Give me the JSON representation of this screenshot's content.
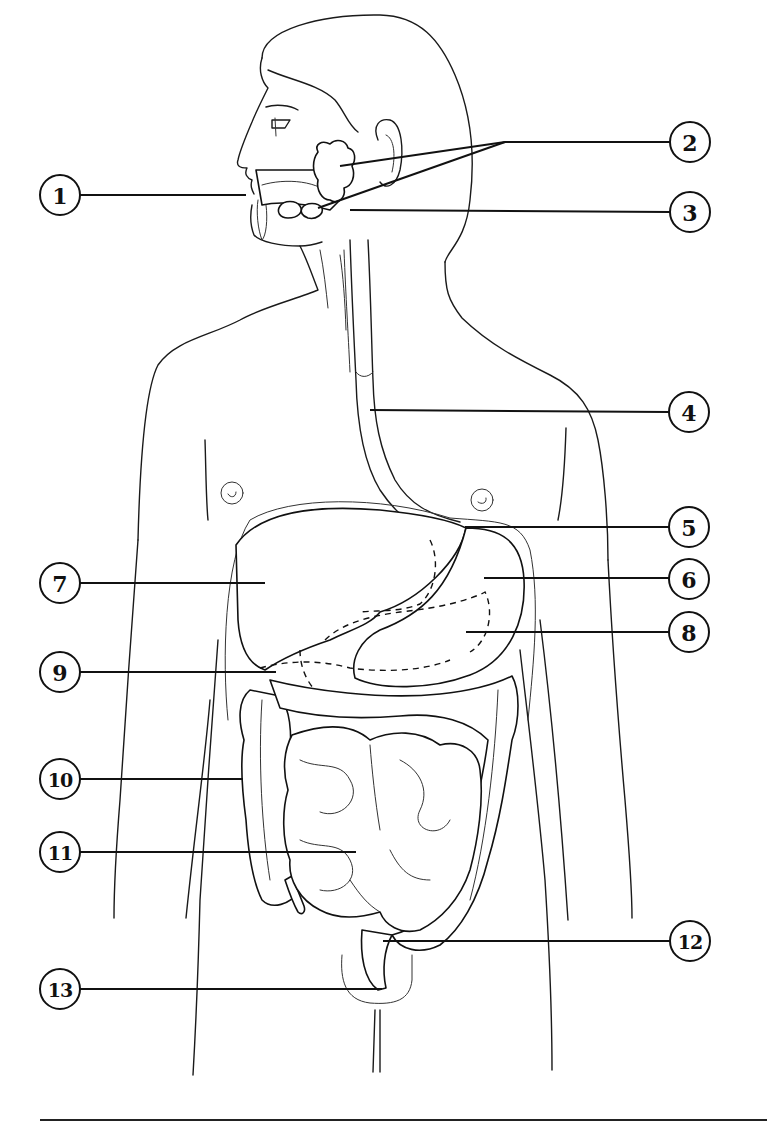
{
  "diagram": {
    "title": "",
    "style": "black line art on white, numbered callouts",
    "colors": {
      "line": "#111111",
      "background": "#ffffff"
    }
  },
  "callouts": [
    {
      "number": "1",
      "side": "left",
      "circle": [
        60,
        195
      ],
      "leader": [
        [
          80,
          195
        ],
        [
          246,
          195
        ]
      ]
    },
    {
      "number": "2",
      "side": "right",
      "circle": [
        690,
        142
      ],
      "leader": [
        [
          670,
          142
        ],
        [
          505,
          142
        ]
      ],
      "branches": [
        [
          [
            505,
            142
          ],
          [
            340,
            166
          ]
        ],
        [
          [
            505,
            142
          ],
          [
            318,
            208
          ]
        ]
      ]
    },
    {
      "number": "3",
      "side": "right",
      "circle": [
        690,
        212
      ],
      "leader": [
        [
          670,
          212
        ],
        [
          350,
          210
        ]
      ]
    },
    {
      "number": "4",
      "side": "right",
      "circle": [
        689,
        412
      ],
      "leader": [
        [
          669,
          412
        ],
        [
          370,
          410
        ]
      ]
    },
    {
      "number": "5",
      "side": "right",
      "circle": [
        689,
        527
      ],
      "leader": [
        [
          669,
          527
        ],
        [
          465,
          527
        ]
      ]
    },
    {
      "number": "6",
      "side": "right",
      "circle": [
        689,
        579
      ],
      "leader": [
        [
          669,
          578
        ],
        [
          484,
          578
        ]
      ]
    },
    {
      "number": "7",
      "side": "left",
      "circle": [
        60,
        583
      ],
      "leader": [
        [
          80,
          583
        ],
        [
          265,
          583
        ]
      ]
    },
    {
      "number": "8",
      "side": "right",
      "circle": [
        689,
        632
      ],
      "leader": [
        [
          669,
          632
        ],
        [
          466,
          632
        ]
      ]
    },
    {
      "number": "9",
      "side": "left",
      "circle": [
        60,
        672
      ],
      "leader": [
        [
          80,
          672
        ],
        [
          276,
          672
        ]
      ]
    },
    {
      "number": "10",
      "side": "left",
      "circle": [
        60,
        779
      ],
      "leader": [
        [
          80,
          779
        ],
        [
          243,
          779
        ]
      ]
    },
    {
      "number": "11",
      "side": "left",
      "circle": [
        60,
        852
      ],
      "leader": [
        [
          80,
          852
        ],
        [
          356,
          852
        ]
      ]
    },
    {
      "number": "12",
      "side": "right",
      "circle": [
        690,
        941
      ],
      "leader": [
        [
          670,
          941
        ],
        [
          383,
          941
        ]
      ]
    },
    {
      "number": "13",
      "side": "left",
      "circle": [
        60,
        989
      ],
      "leader": [
        [
          80,
          989
        ],
        [
          382,
          989
        ]
      ]
    }
  ],
  "footer_rule": {
    "x1": 40,
    "x2": 767,
    "y": 1120
  }
}
